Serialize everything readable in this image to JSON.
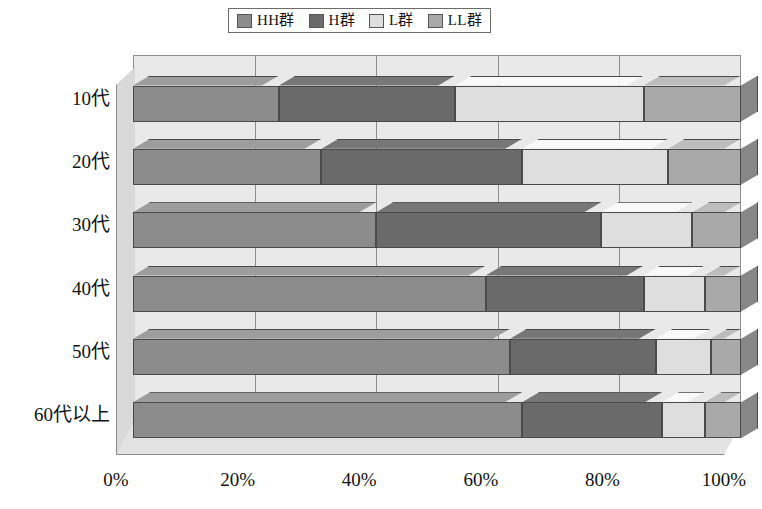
{
  "chart_data": {
    "type": "bar",
    "subtype": "stacked-horizontal-3d",
    "title": "",
    "xlabel": "",
    "ylabel": "",
    "orientation": "horizontal",
    "stacked": true,
    "normalized_percent": true,
    "grid": true,
    "xlim": [
      0,
      100
    ],
    "xticks": [
      0,
      20,
      40,
      60,
      80,
      100
    ],
    "xticklabels": [
      "0%",
      "20%",
      "40%",
      "60%",
      "80%",
      "100%"
    ],
    "categories": [
      "10代",
      "20代",
      "30代",
      "40代",
      "50代",
      "60代以上"
    ],
    "legend": {
      "position": "top-center",
      "entries": [
        "HH群",
        "H群",
        "L群",
        "LL群"
      ]
    },
    "series": [
      {
        "name": "HH群",
        "color": "#8c8c8c",
        "values": [
          24,
          31,
          40,
          58,
          62,
          64
        ]
      },
      {
        "name": "H群",
        "color": "#6a6a6a",
        "values": [
          29,
          33,
          37,
          26,
          24,
          23
        ]
      },
      {
        "name": "L群",
        "color": "#dedede",
        "values": [
          31,
          24,
          15,
          10,
          9,
          7
        ]
      },
      {
        "name": "LL群",
        "color": "#a9a9a9",
        "values": [
          16,
          12,
          8,
          6,
          5,
          6
        ]
      }
    ],
    "cumulative_boundaries": [
      [
        24,
        53,
        84,
        100
      ],
      [
        31,
        64,
        88,
        100
      ],
      [
        40,
        77,
        92,
        100
      ],
      [
        58,
        84,
        94,
        100
      ],
      [
        62,
        86,
        95,
        100
      ],
      [
        64,
        87,
        94,
        100
      ]
    ]
  },
  "colors": {
    "hh_gun": "#8c8c8c",
    "h_gun": "#6a6a6a",
    "l_gun": "#dedede",
    "ll_gun": "#a9a9a9",
    "plot_background": "#e9e9e9",
    "floor": "#e3e3e3",
    "sidewall": "#d9d9d9",
    "gridline": "#8d8d8d",
    "outline": "#4a4a4a",
    "page_background": "#ffffff",
    "text": "#121212"
  }
}
